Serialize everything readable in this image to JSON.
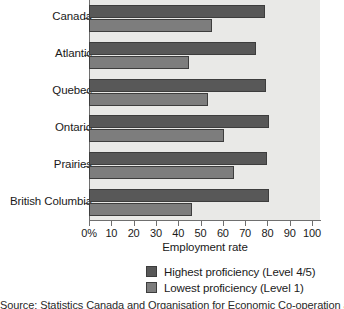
{
  "chart_data": {
    "type": "bar",
    "orientation": "horizontal",
    "title": "",
    "xlabel": "Employment rate",
    "ylabel": "",
    "xlim": [
      0,
      100
    ],
    "xticks": [
      "0%",
      "10",
      "20",
      "30",
      "40",
      "50",
      "60",
      "70",
      "80",
      "90",
      "100"
    ],
    "xtick_values": [
      0,
      10,
      20,
      30,
      40,
      50,
      60,
      70,
      80,
      90,
      100
    ],
    "grid": false,
    "legend_position": "bottom",
    "categories": [
      "Canada",
      "Atlantic",
      "Quebec",
      "Ontario",
      "Prairies",
      "British Columbia"
    ],
    "series": [
      {
        "name": "Highest proficiency (Level 4/5)",
        "color": "#585858",
        "values": [
          79,
          75,
          79.5,
          80.5,
          80,
          80.5
        ]
      },
      {
        "name": "Lowest proficiency (Level 1)",
        "color": "#7d7d7d",
        "values": [
          55,
          45,
          53.5,
          60.5,
          65,
          46
        ]
      }
    ]
  },
  "chart": {
    "x_axis_title": "Employment rate",
    "plot_background": "#e9e9e7",
    "axis_color": "#6f6f6f"
  },
  "legend": {
    "items": [
      {
        "label": "Highest proficiency (Level 4/5)",
        "swatch": "high"
      },
      {
        "label": "Lowest proficiency (Level 1)",
        "swatch": "low"
      }
    ]
  },
  "caption": {
    "partial_text": "Source: Statistics Canada and Organisation for Economic Co-operation and Development."
  }
}
